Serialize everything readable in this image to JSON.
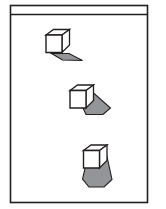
{
  "figure": {
    "title": "",
    "caption": "",
    "background_color": "#ffffff",
    "outline_color": "#231f20",
    "frame": {
      "name": "panel-border",
      "x": 10.5,
      "y": 5.5,
      "width": 137,
      "height": 197,
      "stroke_width": 1.6,
      "fill": "#ffffff"
    },
    "header_rule": {
      "name": "header-divider-line",
      "x1": 10.5,
      "y1": 14.5,
      "x2": 147.5,
      "y2": 14.5,
      "stroke_width": 1.3
    },
    "shadow_color": "#939598",
    "cube_top_fill": "#ffffff",
    "cube_left_fill": "#ffffff",
    "cube_right_fill": "#ffffff",
    "objects": [
      {
        "name": "cube-with-short-shadow",
        "label": "",
        "shadow_direction_deg": 14,
        "shadow_length_px": 29,
        "shadow_points": "51.5,53.5 69.0,53.5 82.5,60.5 62.5,60.0",
        "cube": {
          "front": "46.0,35.0 46.0,52.5 62.0,52.5 62.0,35.0",
          "top": "46.0,35.0 53.5,29.5 69.5,29.5 62.0,35.0",
          "side": "62.0,35.0 69.5,29.5 69.5,45.0 62.0,52.5"
        }
      },
      {
        "name": "cube-with-medium-shadow",
        "label": "",
        "shadow_direction_deg": 36,
        "shadow_length_px": 38,
        "shadow_points": "75.5,92.0 92.5,92.0 110.5,108.0 103.0,114.5 86.0,114.5"
      },
      {
        "name": "cube-with-long-shadow",
        "label": "",
        "shadow_direction_deg": 66,
        "shadow_length_px": 48,
        "shadow_points": "89.0,152.0 106.0,152.0 112.0,179.5 104.0,187.0 89.0,187.0 82.5,179.0"
      }
    ],
    "cubes": [
      {
        "name": "cube-1",
        "front": "46.0,35.0 46.0,52.5 62.0,52.5 62.0,35.0",
        "top": "46.0,35.0 53.5,29.5 69.5,29.5 62.0,35.0",
        "side": "62.0,35.0 69.5,29.5 69.5,45.0 62.0,52.5"
      },
      {
        "name": "cube-2",
        "front": "70.0,90.5 70.0,108.0 86.0,108.0 86.0,90.5",
        "top": "70.0,90.5 77.5,85.0 93.5,85.0 86.0,90.5",
        "side": "86.0,90.5 93.5,85.0 93.5,100.5 86.0,108.0"
      },
      {
        "name": "cube-3",
        "front": "83.5,150.5 83.5,168.0 99.5,168.0 99.5,150.5",
        "top": "83.5,150.5 91.0,145.0 107.0,145.0 99.5,150.5",
        "side": "99.5,150.5 107.0,145.0 107.0,160.5 99.5,168.0"
      }
    ]
  }
}
